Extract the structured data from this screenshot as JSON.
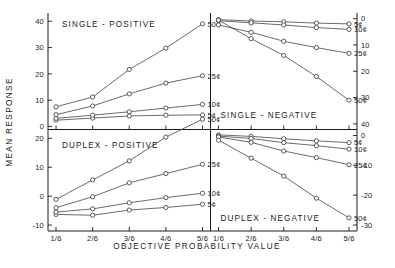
{
  "figure": {
    "y_axis_label": "MEAN RESPONSE",
    "x_axis_label": "OBJECTIVE  PROBABILITY  VALUE",
    "x_tick_labels": [
      "1/6",
      "2/6",
      "3/6",
      "4/6",
      "5/6"
    ],
    "series_labels": [
      "5¢",
      "10¢",
      "25¢",
      "50¢"
    ],
    "marker": "open-circle"
  },
  "chart_data": [
    {
      "type": "line",
      "title": "SINGLE - POSITIVE",
      "panel": "top-left",
      "x": [
        "1/6",
        "2/6",
        "3/6",
        "4/6",
        "5/6"
      ],
      "xlabel": "OBJECTIVE  PROBABILITY  VALUE",
      "ylabel": "MEAN RESPONSE",
      "ylim": [
        0,
        42
      ],
      "y_ticks": [
        0,
        10,
        20,
        30,
        40
      ],
      "y_tick_labels": [
        "0",
        "10",
        "20",
        "30",
        "40"
      ],
      "axis_side": "left",
      "grid": false,
      "legend_position": "right-of-line-ends",
      "series": [
        {
          "name": "5¢",
          "values": [
            2.4,
            3.2,
            4.0,
            4.3,
            4.4
          ]
        },
        {
          "name": "10¢",
          "values": [
            3.1,
            4.3,
            5.6,
            7.0,
            8.4
          ]
        },
        {
          "name": "25¢",
          "values": [
            4.5,
            7.8,
            12.4,
            16.5,
            19.3
          ]
        },
        {
          "name": "50¢",
          "values": [
            7.5,
            11.2,
            21.7,
            29.8,
            39.0
          ]
        }
      ]
    },
    {
      "type": "line",
      "title": "SINGLE - NEGATIVE",
      "panel": "top-right",
      "x": [
        "1/6",
        "2/6",
        "3/6",
        "4/6",
        "5/6"
      ],
      "ylim": [
        -41,
        1
      ],
      "y_ticks": [
        0,
        -10,
        -20,
        -30,
        -40
      ],
      "y_tick_labels": [
        "0",
        "10",
        "20",
        "30",
        "40"
      ],
      "axis_side": "right",
      "grid": false,
      "series": [
        {
          "name": "5¢",
          "values": [
            -0.4,
            -0.9,
            -1.2,
            -1.7,
            -2.0
          ]
        },
        {
          "name": "10¢",
          "values": [
            -0.8,
            -1.6,
            -2.4,
            -3.4,
            -4.1
          ]
        },
        {
          "name": "25¢",
          "values": [
            -2.4,
            -5.2,
            -8.6,
            -11.0,
            -13.2
          ]
        },
        {
          "name": "50¢",
          "values": [
            -0.6,
            -7.6,
            -14.0,
            -22.0,
            -31.0
          ]
        }
      ]
    },
    {
      "type": "line",
      "title": "DUPLEX - POSITIVE",
      "panel": "bottom-left",
      "x": [
        "1/6",
        "2/6",
        "3/6",
        "4/6",
        "5/6"
      ],
      "ylim": [
        -11,
        22
      ],
      "y_ticks": [
        20,
        10,
        0,
        -10
      ],
      "y_tick_labels": [
        "20",
        "10",
        "0",
        "-10"
      ],
      "axis_side": "left",
      "grid": false,
      "series": [
        {
          "name": "5¢",
          "values": [
            -6.3,
            -6.6,
            -4.8,
            -3.9,
            -2.8
          ]
        },
        {
          "name": "10¢",
          "values": [
            -5.5,
            -4.4,
            -2.3,
            -0.5,
            1.0
          ]
        },
        {
          "name": "25¢",
          "values": [
            -4.0,
            -0.2,
            4.6,
            7.8,
            11.0
          ]
        },
        {
          "name": "50¢",
          "values": [
            -1.1,
            5.6,
            12.2,
            20.4,
            26.6
          ]
        }
      ]
    },
    {
      "type": "line",
      "title": "DUPLEX - NEGATIVE",
      "panel": "bottom-right",
      "x": [
        "1/6",
        "2/6",
        "3/6",
        "4/6",
        "5/6"
      ],
      "ylim": [
        -31,
        1
      ],
      "y_ticks": [
        0,
        -10,
        -20,
        -30
      ],
      "y_tick_labels": [
        "0",
        "-10",
        "-20",
        "-30"
      ],
      "axis_side": "right",
      "grid": false,
      "series": [
        {
          "name": "5¢",
          "values": [
            0.2,
            -0.3,
            -1.1,
            -1.8,
            -2.4
          ]
        },
        {
          "name": "10¢",
          "values": [
            -0.2,
            -1.0,
            -2.4,
            -3.4,
            -4.6
          ]
        },
        {
          "name": "25¢",
          "values": [
            -0.5,
            -2.3,
            -5.2,
            -7.4,
            -9.8
          ]
        },
        {
          "name": "50¢",
          "values": [
            -1.6,
            -7.6,
            -13.6,
            -21.0,
            -27.6
          ]
        }
      ]
    }
  ]
}
